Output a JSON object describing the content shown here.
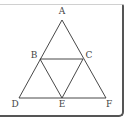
{
  "figure": {
    "type": "geometry",
    "points": [
      {
        "label": "A",
        "x": 62,
        "y": 20,
        "lx": 62,
        "ly": 14
      },
      {
        "label": "B",
        "x": 40,
        "y": 59,
        "lx": 34,
        "ly": 57
      },
      {
        "label": "C",
        "x": 83,
        "y": 59,
        "lx": 89,
        "ly": 57
      },
      {
        "label": "D",
        "x": 19,
        "y": 98,
        "lx": 15,
        "ly": 106
      },
      {
        "label": "E",
        "x": 62,
        "y": 98,
        "lx": 62,
        "ly": 106
      },
      {
        "label": "F",
        "x": 106,
        "y": 98,
        "lx": 109,
        "ly": 106
      }
    ],
    "segments": [
      [
        "A",
        "D"
      ],
      [
        "A",
        "F"
      ],
      [
        "D",
        "F"
      ],
      [
        "B",
        "C"
      ],
      [
        "B",
        "E"
      ],
      [
        "C",
        "E"
      ]
    ],
    "line_color": "#333333"
  }
}
